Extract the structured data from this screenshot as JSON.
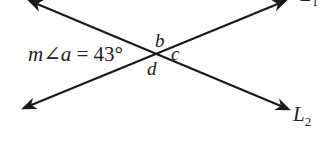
{
  "diagram": {
    "type": "intersecting-lines",
    "lines": [
      {
        "name": "L1",
        "label": "L",
        "subscript": "1",
        "from": [
          22,
          109
        ],
        "to": [
          287,
          0
        ]
      },
      {
        "name": "L2",
        "label": "L",
        "subscript": "2",
        "from": [
          28,
          0
        ],
        "to": [
          290,
          110
        ]
      }
    ],
    "intersection": [
      156,
      53
    ],
    "angle_labels": {
      "b": "b",
      "c": "c",
      "d": "d"
    },
    "measure_text": {
      "prefix": "m∠a",
      "equals": "=",
      "value": "43°"
    },
    "colors": {
      "stroke": "#1a1a1a",
      "text": "#222222"
    }
  }
}
